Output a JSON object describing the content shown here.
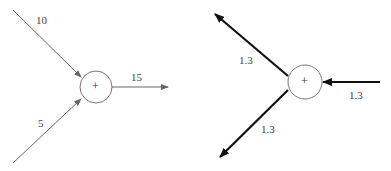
{
  "left_diagram": {
    "node_symbol": "+",
    "inputs": [
      {
        "label": "10"
      },
      {
        "label": "5"
      }
    ],
    "output": {
      "label": "15"
    },
    "edge_color": "#666666"
  },
  "right_diagram": {
    "node_symbol": "+",
    "input": {
      "label": "1.3"
    },
    "outputs": [
      {
        "label": "1.3"
      },
      {
        "label": "1.3"
      }
    ],
    "edge_color": "#111111"
  }
}
